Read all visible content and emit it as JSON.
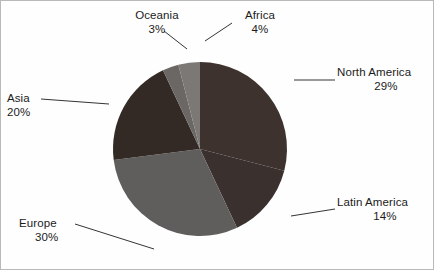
{
  "chart_data": {
    "type": "pie",
    "title": "",
    "subtitle": "",
    "xlabel": "",
    "ylabel": "",
    "legend_position": "none",
    "grid": false,
    "start_angle_deg": 0,
    "direction": "clockwise",
    "categories": [
      "North America",
      "Latin America",
      "Europe",
      "Asia",
      "Oceania",
      "Africa"
    ],
    "values": [
      29,
      14,
      30,
      20,
      3,
      4
    ],
    "value_unit": "%",
    "slices": [
      {
        "label": "North America",
        "value": 29,
        "pct_text": "29%",
        "color": "#3d322e"
      },
      {
        "label": "Latin America",
        "value": 14,
        "pct_text": "14%",
        "color": "#3a302d"
      },
      {
        "label": "Europe",
        "value": 30,
        "pct_text": "30%",
        "color": "#605e5d"
      },
      {
        "label": "Asia",
        "value": 20,
        "pct_text": "20%",
        "color": "#332a26"
      },
      {
        "label": "Oceania",
        "value": 3,
        "pct_text": "3%",
        "color": "#6a6765"
      },
      {
        "label": "Africa",
        "value": 4,
        "pct_text": "4%",
        "color": "#7c7876"
      }
    ]
  },
  "labels": {
    "oceania": {
      "name": "Oceania",
      "pct": "3%"
    },
    "africa": {
      "name": "Africa",
      "pct": "4%"
    },
    "north_america": {
      "name": "North America",
      "pct": "29%"
    },
    "latin_america": {
      "name": "Latin America",
      "pct": "14%"
    },
    "asia": {
      "name": "Asia",
      "pct": "20%"
    },
    "europe": {
      "name": "Europe",
      "pct": "30%"
    }
  },
  "colors": {
    "background": "#fefefe",
    "border": "#b9b9b9",
    "text": "#1b1b1b",
    "leader_line": "#1d1d1d"
  }
}
